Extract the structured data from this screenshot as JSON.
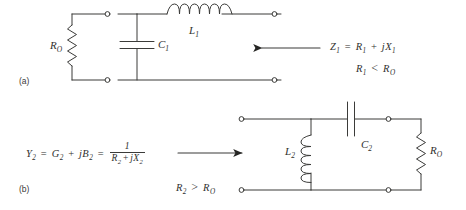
{
  "figure": {
    "kind": "circuit-diagram",
    "ink_color": "#3b3b39",
    "paper_color": "#ffffff"
  },
  "panel_a": {
    "tag": "(a)",
    "components": [
      {
        "name": "resistor-ro",
        "label": "R",
        "subscript": "O",
        "type": "resistor",
        "orientation": "vertical"
      },
      {
        "name": "capacitor-c1",
        "label": "C",
        "subscript": "1",
        "type": "capacitor",
        "orientation": "vertical"
      },
      {
        "name": "inductor-l1",
        "label": "L",
        "subscript": "1",
        "type": "inductor",
        "orientation": "horizontal"
      }
    ],
    "labels": {
      "ro": "R",
      "ro_sub": "O",
      "c1": "C",
      "c1_sub": "1",
      "l1": "L",
      "l1_sub": "1"
    },
    "annotation": {
      "arrow_direction": "left",
      "line1": {
        "lhs": "Z",
        "lhs_sub": "1",
        "eq": "=",
        "t1": "R",
        "t1_sub": "1",
        "plus": "+",
        "t2": "jX",
        "t2_sub": "1"
      },
      "line2": {
        "lhs": "R",
        "lhs_sub": "1",
        "rel": "<",
        "rhs": "R",
        "rhs_sub": "O"
      },
      "line1_text": "Z1 = R1 + jX1",
      "line2_text": "R1 < RO"
    }
  },
  "panel_b": {
    "tag": "(b)",
    "components": [
      {
        "name": "inductor-l2",
        "label": "L",
        "subscript": "2",
        "type": "inductor",
        "orientation": "vertical"
      },
      {
        "name": "capacitor-c2",
        "label": "C",
        "subscript": "2",
        "type": "capacitor",
        "orientation": "horizontal"
      },
      {
        "name": "resistor-ro",
        "label": "R",
        "subscript": "O",
        "type": "resistor",
        "orientation": "vertical"
      }
    ],
    "labels": {
      "l2": "L",
      "l2_sub": "2",
      "c2": "C",
      "c2_sub": "2",
      "ro": "R",
      "ro_sub": "O"
    },
    "annotation": {
      "arrow_direction": "right",
      "equation": {
        "lhs": "Y",
        "lhs_sub": "2",
        "eq1": "=",
        "t1": "G",
        "t1_sub": "2",
        "plus": "+",
        "t2": "jB",
        "t2_sub": "2",
        "eq2": "=",
        "frac_num": "1",
        "frac_den_a": "R",
        "frac_den_a_sub": "2",
        "frac_den_plus": "+",
        "frac_den_b": "jX",
        "frac_den_b_sub": "2"
      },
      "equation_text": "Y2 = G2 + jB2 = 1/(R2 + jX2)",
      "condition": {
        "lhs": "R",
        "lhs_sub": "2",
        "rel": ">",
        "rhs": "R",
        "rhs_sub": "O"
      },
      "condition_text": "R2 > RO"
    }
  }
}
